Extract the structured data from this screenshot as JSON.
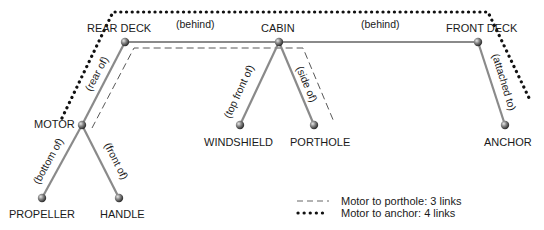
{
  "diagram": {
    "nodes": [
      {
        "id": "rear_deck",
        "label": "REAR DECK",
        "x": 125,
        "y": 42
      },
      {
        "id": "cabin",
        "label": "CABIN",
        "x": 279,
        "y": 42
      },
      {
        "id": "front_deck",
        "label": "FRONT DECK",
        "x": 478,
        "y": 42
      },
      {
        "id": "motor",
        "label": "MOTOR",
        "x": 82,
        "y": 125
      },
      {
        "id": "propeller",
        "label": "PROPELLER",
        "x": 42,
        "y": 198
      },
      {
        "id": "handle",
        "label": "HANDLE",
        "x": 119,
        "y": 198
      },
      {
        "id": "windshield",
        "label": "WINDSHIELD",
        "x": 240,
        "y": 125
      },
      {
        "id": "porthole",
        "label": "PORTHOLE",
        "x": 314,
        "y": 125
      },
      {
        "id": "anchor",
        "label": "ANCHOR",
        "x": 505,
        "y": 125
      }
    ],
    "edges": [
      {
        "from": "rear_deck",
        "to": "cabin",
        "label": "(behind)"
      },
      {
        "from": "cabin",
        "to": "front_deck",
        "label": "(behind)"
      },
      {
        "from": "motor",
        "to": "rear_deck",
        "label": "(rear of)"
      },
      {
        "from": "propeller",
        "to": "motor",
        "label": "(bottom of)"
      },
      {
        "from": "handle",
        "to": "motor",
        "label": "(front of)"
      },
      {
        "from": "windshield",
        "to": "cabin",
        "label": "(top front of)"
      },
      {
        "from": "porthole",
        "to": "cabin",
        "label": "(side of)"
      },
      {
        "from": "anchor",
        "to": "front_deck",
        "label": "(attached to)"
      }
    ],
    "legend": [
      {
        "style": "dashed",
        "label": "Motor to porthole: 3 links"
      },
      {
        "style": "dotted",
        "label": "Motor to anchor: 4 links"
      }
    ],
    "colors": {
      "edge": "#8a8a8a",
      "node": "#555555",
      "path": "#111111"
    }
  }
}
